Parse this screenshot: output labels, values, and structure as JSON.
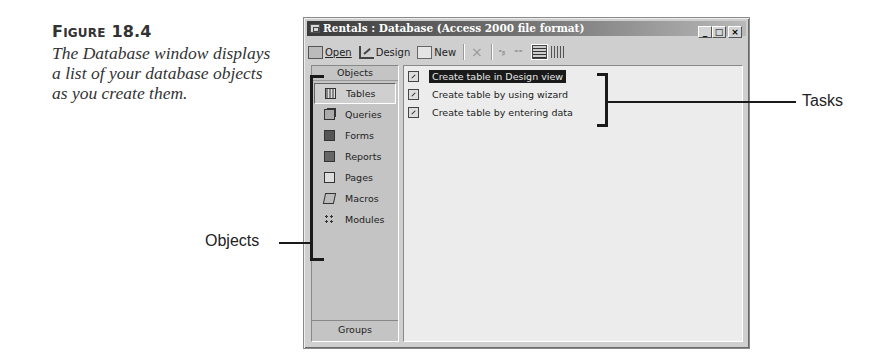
{
  "caption": {
    "figure_label_prefix": "F",
    "figure_label_smallcaps": "IGURE",
    "figure_number": "18.4",
    "text": "The Database window displays a list of your database objects as you create them."
  },
  "window": {
    "title": "Rentals : Database (Access 2000 file format)",
    "controls": {
      "minimize": "_",
      "maximize": "□",
      "close": "×"
    }
  },
  "toolbar": {
    "open_label": "Open",
    "design_label": "Design",
    "new_label": "New",
    "delete_icon": "×",
    "large_icons": "ᵃᵦ",
    "small_icons": "⁼⁼"
  },
  "objects_pane": {
    "header": "Objects",
    "items": [
      {
        "label": "Tables",
        "icon": "table-icon",
        "selected": true
      },
      {
        "label": "Queries",
        "icon": "query-icon",
        "selected": false
      },
      {
        "label": "Forms",
        "icon": "form-icon",
        "selected": false
      },
      {
        "label": "Reports",
        "icon": "report-icon",
        "selected": false
      },
      {
        "label": "Pages",
        "icon": "page-icon",
        "selected": false
      },
      {
        "label": "Macros",
        "icon": "macro-icon",
        "selected": false
      },
      {
        "label": "Modules",
        "icon": "module-icon",
        "selected": false
      }
    ],
    "groups_label": "Groups"
  },
  "tasks_pane": {
    "items": [
      {
        "label": "Create table in Design view",
        "selected": true
      },
      {
        "label": "Create table by using wizard",
        "selected": false
      },
      {
        "label": "Create table by entering data",
        "selected": false
      }
    ]
  },
  "annotations": {
    "tasks_label": "Tasks",
    "objects_label": "Objects"
  }
}
